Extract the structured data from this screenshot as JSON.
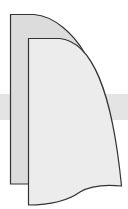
{
  "image": {
    "description": "Two overlapping curved page shapes over a horizontal gray band",
    "colors": {
      "background": "#ffffff",
      "band": "#e4e4e4",
      "back_page_fill": "#dcdcdc",
      "front_page_fill": "#ececec",
      "outline": "#333333"
    }
  }
}
